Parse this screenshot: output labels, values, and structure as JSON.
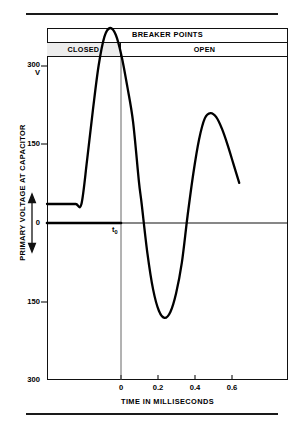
{
  "figure": {
    "title_band": "BREAKER POINTS",
    "state_closed": "CLOSED",
    "state_open": "OPEN",
    "origin_marker": "t",
    "origin_marker_sub": "0"
  },
  "chart_data": {
    "type": "line",
    "title": "",
    "xlabel": "TIME IN MILLISECONDS",
    "ylabel": "PRIMARY VOLTAGE AT CAPACITOR",
    "xlim": [
      -0.12,
      0.72
    ],
    "ylim": [
      -300,
      300
    ],
    "xticks": [
      0,
      0.2,
      0.4,
      0.6
    ],
    "xtick_labels": [
      "0",
      "0.2",
      "0.4",
      "0.6"
    ],
    "yticks": [
      300,
      150,
      0,
      -150,
      -300
    ],
    "ytick_labels": [
      "300",
      "150",
      "0",
      "150",
      "300"
    ],
    "y_unit": "V",
    "grid": false,
    "legend": null,
    "annotations": [
      {
        "text": "t0",
        "x": 0,
        "y": 0,
        "note": "breaker points open at t-zero"
      },
      {
        "text": "BREAKER POINTS",
        "region": "header"
      },
      {
        "text": "CLOSED",
        "x_range": [
          -0.12,
          0.0
        ],
        "shaded": true
      },
      {
        "text": "OPEN",
        "x_range": [
          0.0,
          0.72
        ],
        "shaded": false
      }
    ],
    "series": [
      {
        "name": "primary voltage at capacitor",
        "color": "#000000",
        "x": [
          -0.12,
          -0.06,
          -0.02,
          0.0,
          0.02,
          0.04,
          0.06,
          0.08,
          0.1,
          0.12,
          0.14,
          0.16,
          0.18,
          0.2,
          0.21,
          0.23,
          0.25,
          0.27,
          0.29,
          0.31,
          0.33,
          0.35,
          0.37,
          0.39,
          0.41,
          0.43,
          0.45,
          0.47,
          0.49,
          0.51,
          0.53,
          0.55
        ],
        "y": [
          0,
          0,
          0,
          0,
          76,
          160,
          236,
          285,
          300,
          288,
          252,
          200,
          140,
          40,
          0,
          -84,
          -146,
          -182,
          -194,
          -184,
          -152,
          -100,
          -20,
          52,
          110,
          146,
          155,
          148,
          128,
          100,
          68,
          36
        ]
      }
    ]
  }
}
